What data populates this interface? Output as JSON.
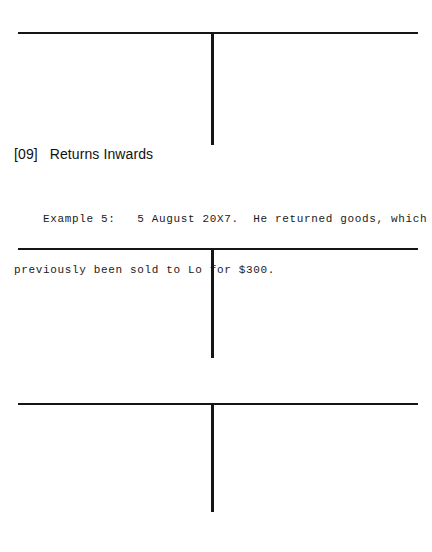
{
  "page": {
    "background_color": "#ffffff",
    "ink_color": "#151515",
    "width": 432,
    "height": 552
  },
  "section": {
    "number": "[09]",
    "title": "Returns Inwards",
    "heading_full": "[09]   Returns Inwards"
  },
  "example": {
    "label": "Example 5:",
    "date": "5 August 20X7.",
    "line_1": "    Example 5:   5 August 20X7.  He returned goods, which had",
    "line_2": "previously been sold to Lo for $300.",
    "amount": "$300.",
    "customer": "Lo"
  },
  "ledgers": [
    {
      "name": "t-account-1",
      "label": "",
      "debit_entries": [],
      "credit_entries": []
    },
    {
      "name": "t-account-2",
      "label": "",
      "debit_entries": [],
      "credit_entries": []
    },
    {
      "name": "t-account-3",
      "label": "",
      "debit_entries": [],
      "credit_entries": []
    }
  ]
}
